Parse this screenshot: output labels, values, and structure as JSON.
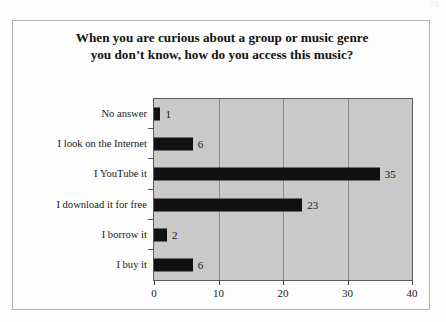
{
  "page": {
    "page_number_artifact": "76"
  },
  "chart_data": {
    "type": "bar",
    "orientation": "horizontal",
    "title": "When you are curious about a group or music genre you don’t know, how do you access this music?",
    "title_lines": [
      "When you are curious about a group or music genre",
      "you don’t know, how do you access this music?"
    ],
    "categories": [
      "No answer",
      "I look on the Internet",
      "I YouTube it",
      "I download it for free",
      "I borrow it",
      "I buy it"
    ],
    "values": [
      1,
      6,
      35,
      23,
      2,
      6
    ],
    "data_labels": [
      "1",
      "6",
      "35",
      "23",
      "2",
      "6"
    ],
    "xlabel": "",
    "ylabel": "",
    "xlim": [
      0,
      40
    ],
    "xticks": [
      0,
      10,
      20,
      30,
      40
    ],
    "xtick_labels": [
      "0",
      "10",
      "20",
      "30",
      "40"
    ],
    "gridlines": [
      10,
      20,
      30
    ],
    "grid": true,
    "legend": false,
    "colors": {
      "bar": "#111111",
      "plot_background": "#c9c9c9",
      "gridline": "#8d8d8d",
      "plot_border": "#5a5a5a",
      "page_background": "#fdfdfd",
      "figure_border": "#b4b4b4",
      "text": "#1a1a1a"
    }
  }
}
